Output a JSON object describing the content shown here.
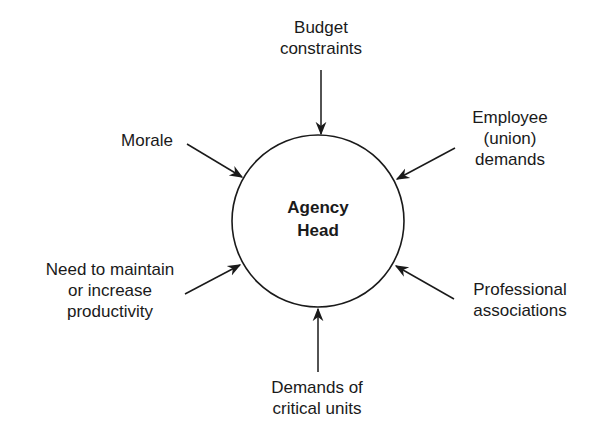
{
  "diagram": {
    "center": {
      "label": "Agency\nHead"
    },
    "influences": [
      {
        "id": "budget",
        "label": "Budget\nconstraints",
        "position": "top"
      },
      {
        "id": "employee",
        "label": "Employee\n(union)\ndemands",
        "position": "upper-right"
      },
      {
        "id": "professional",
        "label": "Professional\nassociations",
        "position": "lower-right"
      },
      {
        "id": "critical-units",
        "label": "Demands of\ncritical units",
        "position": "bottom"
      },
      {
        "id": "productivity",
        "label": "Need to maintain\nor increase\nproductivity",
        "position": "lower-left"
      },
      {
        "id": "morale",
        "label": "Morale",
        "position": "upper-left"
      }
    ],
    "colors": {
      "stroke": "#1a1a1a",
      "background": "#ffffff"
    }
  }
}
